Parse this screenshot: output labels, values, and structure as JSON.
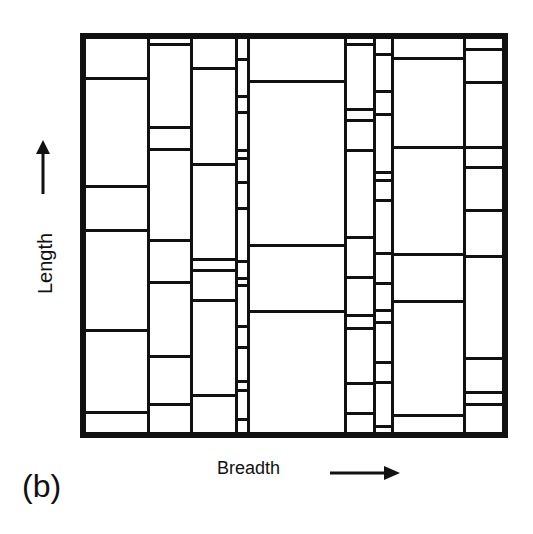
{
  "figure": {
    "panel_label": "(b)",
    "axis_labels": {
      "vertical": "Length",
      "horizontal": "Breadth"
    },
    "arrows": {
      "vertical": "arrow-up",
      "horizontal": "arrow-right"
    },
    "colors": {
      "line": "#111111",
      "background": "#ffffff"
    },
    "frame": {
      "left": 80,
      "top": 33,
      "right": 508,
      "bottom": 438,
      "border": 6
    },
    "columns": [
      {
        "x0": 86,
        "x1": 148,
        "cuts": [
          78,
          186,
          230,
          330,
          412
        ]
      },
      {
        "x0": 148,
        "x1": 191,
        "cuts": [
          44,
          127,
          149,
          240,
          282,
          356,
          404
        ]
      },
      {
        "x0": 191,
        "x1": 236,
        "cuts": [
          68,
          164,
          259,
          270,
          300,
          395
        ]
      },
      {
        "x0": 236,
        "x1": 248,
        "cuts": [
          59,
          96,
          112,
          150,
          158,
          182,
          208,
          261,
          278,
          285,
          326,
          347,
          381,
          390,
          419
        ]
      },
      {
        "x0": 248,
        "x1": 345,
        "cuts": [
          81,
          245,
          311
        ]
      },
      {
        "x0": 345,
        "x1": 374,
        "cuts": [
          44,
          109,
          120,
          150,
          237,
          277,
          315,
          328,
          383,
          413
        ]
      },
      {
        "x0": 374,
        "x1": 392,
        "cuts": [
          54,
          91,
          114,
          172,
          180,
          200,
          253,
          283,
          310,
          322,
          362,
          382,
          426
        ]
      },
      {
        "x0": 392,
        "x1": 464,
        "cuts": [
          58,
          147,
          254,
          301,
          415
        ]
      },
      {
        "x0": 464,
        "x1": 502,
        "cuts": [
          49,
          82,
          147,
          167,
          210,
          256,
          358,
          392,
          404
        ]
      }
    ]
  }
}
